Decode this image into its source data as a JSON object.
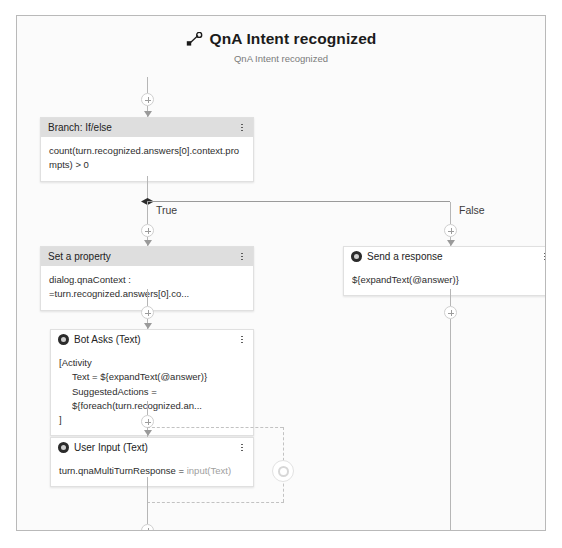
{
  "trigger": {
    "icon": "trigger-node-icon",
    "title": "QnA Intent recognized",
    "subtitle": "QnA Intent recognized"
  },
  "branch_labels": {
    "true": "True",
    "false": "False"
  },
  "nodes": {
    "branch": {
      "icon": "none",
      "title": "Branch: If/else",
      "body": "count(turn.recognized.answers[0].context.prompts) > 0",
      "menu": "more-options"
    },
    "set_property": {
      "icon": "none",
      "title": "Set a property",
      "body": "dialog.qnaContext : =turn.recognized.answers[0].co...",
      "menu": "more-options"
    },
    "send_response": {
      "icon": "send-response-icon",
      "title": "Send a response",
      "body": "${expandText(@answer)}",
      "menu": "more-options"
    },
    "bot_asks": {
      "icon": "bot-asks-icon",
      "title": "Bot Asks (Text)",
      "body_line1": "[Activity",
      "body_line2": "Text = ${expandText(@answer)}",
      "body_line3": "SuggestedActions = ${foreach(turn.recognized.an...",
      "body_line4": "]",
      "menu": "more-options"
    },
    "user_input": {
      "icon": "user-input-icon",
      "title": "User Input (Text)",
      "body_property": "turn.qnaMultiTurnResponse = ",
      "body_value": "input(Text)",
      "menu": "more-options"
    }
  },
  "loop": {
    "icon": "loop-node-icon"
  },
  "colors": {
    "canvas_bg": "#fbfbfb",
    "canvas_border": "#b9b9b9",
    "card_header_gray": "#dedede",
    "card_border": "#e0e0e0",
    "connector": "#b6b6b6",
    "diamond": "#2b2b2b",
    "icon_dark": "#2b2b2b"
  }
}
